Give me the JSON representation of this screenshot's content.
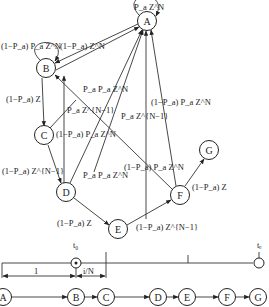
{
  "state_graph": {
    "nodes": [
      {
        "id": "A",
        "label": "A"
      },
      {
        "id": "B",
        "label": "B"
      },
      {
        "id": "C",
        "label": "C"
      },
      {
        "id": "D",
        "label": "D"
      },
      {
        "id": "E",
        "label": "E"
      },
      {
        "id": "F",
        "label": "F"
      },
      {
        "id": "G",
        "label": "G"
      }
    ],
    "edges": [
      {
        "from": "A",
        "to": "A",
        "label": "P_a Z^N"
      },
      {
        "from": "B",
        "to": "B",
        "label": "(1−P_a) P_a Z^N"
      },
      {
        "from": "A",
        "to": "B",
        "label": "(1−P_a) Z^N"
      },
      {
        "from": "B",
        "to": "A",
        "label": "P_a P_a Z^N"
      },
      {
        "from": "B",
        "to": "C",
        "label": "(1−P_a) Z"
      },
      {
        "from": "C",
        "to": "B",
        "label": "P_a Z^{N−1}"
      },
      {
        "from": "C",
        "to": "A",
        "label": "(1−P_a) P_a Z^N"
      },
      {
        "from": "C",
        "to": "D",
        "label": "(1−P_a) Z^{N−1}"
      },
      {
        "from": "D",
        "to": "A",
        "label": "P_a P_a Z^N"
      },
      {
        "from": "D",
        "to": "E",
        "label": "(1−P_a) Z"
      },
      {
        "from": "E",
        "to": "A",
        "label": "P_a Z^{N−1}"
      },
      {
        "from": "F",
        "to": "A",
        "label": "(1−P_a) P_a Z^N"
      },
      {
        "from": "F",
        "to": "B",
        "label": "(1−P_a) P_a Z^N"
      },
      {
        "from": "E",
        "to": "F",
        "label": "(1−P_a) Z^{N−1}"
      },
      {
        "from": "F",
        "to": "G",
        "label": "(1−P_a) Z"
      }
    ]
  },
  "timeline": {
    "t0_label": "t₀",
    "te_label": "tₑ",
    "segment_1_label": "1",
    "segment_2_label": "i/N",
    "sequence": [
      "A",
      "B",
      "C",
      "D",
      "E",
      "F",
      "G"
    ]
  }
}
